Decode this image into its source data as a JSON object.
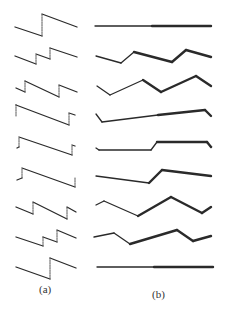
{
  "figure": {
    "captions": {
      "a": "(a)",
      "b": "(b)"
    },
    "colors": {
      "stroke": "#2a2a2a",
      "dashed": "#555555",
      "background": "#ffffff"
    },
    "panel_a": {
      "description": "Sawtooth-like waveforms: sloped solid segments joined by dashed vertical jumps",
      "rows": [
        {
          "solid": [
            [
              [
                15,
                27
              ],
              [
                42,
                36
              ]
            ],
            [
              [
                42,
                14
              ],
              [
                77,
                27
              ]
            ]
          ],
          "dashed": [
            [
              [
                42,
                36
              ],
              [
                42,
                14
              ]
            ]
          ]
        },
        {
          "solid": [
            [
              [
                15,
                56
              ],
              [
                36,
                64
              ]
            ],
            [
              [
                36,
                54
              ],
              [
                50,
                59
              ]
            ],
            [
              [
                50,
                48
              ],
              [
                77,
                57
              ]
            ]
          ],
          "dashed": [
            [
              [
                36,
                64
              ],
              [
                36,
                54
              ]
            ],
            [
              [
                50,
                59
              ],
              [
                50,
                48
              ]
            ]
          ]
        },
        {
          "solid": [
            [
              [
                16,
                88
              ],
              [
                25,
                92
              ]
            ],
            [
              [
                25,
                81
              ],
              [
                59,
                97
              ]
            ],
            [
              [
                59,
                85
              ],
              [
                77,
                92
              ]
            ]
          ],
          "dashed": [
            [
              [
                25,
                92
              ],
              [
                25,
                81
              ]
            ],
            [
              [
                59,
                97
              ],
              [
                59,
                85
              ]
            ]
          ]
        },
        {
          "solid": [
            [
              [
                16,
                105
              ],
              [
                69,
                125
              ]
            ],
            [
              [
                69,
                113
              ],
              [
                75,
                115
              ]
            ]
          ],
          "dashed": [
            [
              [
                16,
                116
              ],
              [
                16,
                104
              ]
            ],
            [
              [
                69,
                125
              ],
              [
                69,
                113
              ]
            ]
          ]
        },
        {
          "solid": [
            [
              [
                17,
                148
              ],
              [
                19,
                147
              ]
            ],
            [
              [
                19,
                137
              ],
              [
                72,
                155
              ]
            ],
            [
              [
                72,
                145
              ],
              [
                75,
                146
              ]
            ]
          ],
          "dashed": [
            [
              [
                19,
                147
              ],
              [
                19,
                137
              ]
            ],
            [
              [
                72,
                155
              ],
              [
                72,
                145
              ]
            ]
          ]
        },
        {
          "solid": [
            [
              [
                17,
                180
              ],
              [
                22,
                178
              ]
            ],
            [
              [
                22,
                168
              ],
              [
                75,
                187
              ]
            ]
          ],
          "dashed": [
            [
              [
                22,
                178
              ],
              [
                22,
                168
              ]
            ],
            [
              [
                75,
                187
              ],
              [
                75,
                177
              ]
            ]
          ]
        },
        {
          "solid": [
            [
              [
                16,
                207
              ],
              [
                33,
                214
              ]
            ],
            [
              [
                33,
                202
              ],
              [
                67,
                219
              ]
            ],
            [
              [
                67,
                207
              ],
              [
                76,
                212
              ]
            ]
          ],
          "dashed": [
            [
              [
                33,
                214
              ],
              [
                33,
                202
              ]
            ],
            [
              [
                67,
                219
              ],
              [
                67,
                207
              ]
            ]
          ]
        },
        {
          "solid": [
            [
              [
                16,
                237
              ],
              [
                43,
                246
              ]
            ],
            [
              [
                43,
                237
              ],
              [
                57,
                242
              ]
            ],
            [
              [
                57,
                230
              ],
              [
                76,
                238
              ]
            ]
          ],
          "dashed": [
            [
              [
                43,
                246
              ],
              [
                43,
                237
              ]
            ],
            [
              [
                57,
                242
              ],
              [
                57,
                230
              ]
            ]
          ]
        },
        {
          "solid": [
            [
              [
                16,
                267
              ],
              [
                50,
                279
              ]
            ],
            [
              [
                50,
                258
              ],
              [
                76,
                268
              ]
            ]
          ],
          "dashed": [
            [
              [
                50,
                279
              ],
              [
                50,
                258
              ]
            ]
          ]
        }
      ]
    },
    "panel_b": {
      "description": "Piecewise-linear polylines, thin then thicker segments",
      "rows": [
        {
          "points": [
            [
              95,
              26
            ],
            [
              152,
              26
            ],
            [
              211,
              26
            ]
          ],
          "thick_from": 1
        },
        {
          "points": [
            [
              96,
              56
            ],
            [
              121,
              63
            ],
            [
              134,
              52
            ],
            [
              172,
              62
            ],
            [
              186,
              50
            ],
            [
              211,
              57
            ]
          ],
          "thick_from": 2
        },
        {
          "points": [
            [
              97,
              86
            ],
            [
              110,
              95
            ],
            [
              143,
              80
            ],
            [
              161,
              92
            ],
            [
              196,
              76
            ],
            [
              211,
              86
            ]
          ],
          "thick_from": 2
        },
        {
          "points": [
            [
              96,
              114
            ],
            [
              102,
              122
            ],
            [
              158,
              115
            ],
            [
              205,
              110
            ],
            [
              211,
              116
            ]
          ],
          "thick_from": 2
        },
        {
          "points": [
            [
              96,
              148
            ],
            [
              99,
              150
            ],
            [
              151,
              150
            ],
            [
              157,
              142
            ],
            [
              207,
              142
            ],
            [
              211,
              147
            ]
          ],
          "thick_from": 3
        },
        {
          "points": [
            [
              96,
              176
            ],
            [
              149,
              183
            ],
            [
              162,
              170
            ],
            [
              211,
              176
            ]
          ],
          "thick_from": 1
        },
        {
          "points": [
            [
              96,
              205
            ],
            [
              104,
              201
            ],
            [
              138,
              216
            ],
            [
              171,
              197
            ],
            [
              202,
              213
            ],
            [
              211,
              207
            ]
          ],
          "thick_from": 2
        },
        {
          "points": [
            [
              94,
              237
            ],
            [
              114,
              233
            ],
            [
              130,
              244
            ],
            [
              177,
              230
            ],
            [
              193,
              241
            ],
            [
              211,
              236
            ]
          ],
          "thick_from": 2
        },
        {
          "points": [
            [
              97,
              267
            ],
            [
              154,
              267
            ],
            [
              213,
              267
            ]
          ],
          "thick_from": 1
        }
      ]
    }
  }
}
